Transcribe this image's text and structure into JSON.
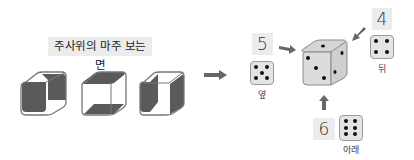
{
  "left_panel": {
    "title": "주사위의 마주 보는 면",
    "cubes": [
      {
        "name": "cube-front-back-shaded",
        "shaded_faces": [
          "front-left",
          "back-right"
        ]
      },
      {
        "name": "cube-top-bottom-shaded",
        "shaded_faces": [
          "top",
          "bottom"
        ]
      },
      {
        "name": "cube-left-right-shaded",
        "shaded_faces": [
          "left",
          "right"
        ]
      }
    ]
  },
  "transition_arrow": {
    "icon": "arrow-right-icon"
  },
  "right_panel": {
    "main_die": {
      "visible_faces": {
        "top": 1,
        "left": 3,
        "right": 2
      }
    },
    "hidden_faces": [
      {
        "position": "side",
        "label": "옆",
        "value": "5",
        "pips": 5,
        "arrow": "arrow-right-icon"
      },
      {
        "position": "back",
        "label": "뒤",
        "value": "4",
        "pips": 4,
        "arrow": "arrow-down-left-icon"
      },
      {
        "position": "bottom",
        "label": "아래",
        "value": "6",
        "pips": 6,
        "arrow": "arrow-up-icon"
      }
    ]
  },
  "colors": {
    "shade": "#5a5a5a",
    "outline": "#888888",
    "label_bg": "#ececec",
    "die_face": "#dcdcdc",
    "arrow": "#6a6a6a"
  }
}
